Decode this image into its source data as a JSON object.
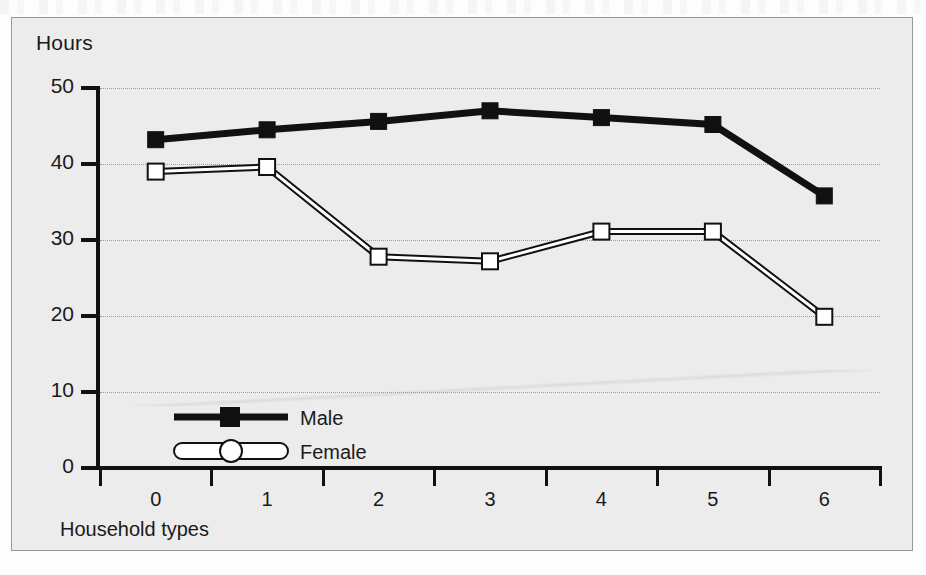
{
  "figure": {
    "background_color": "#ececec",
    "border_color": "#9a9a9a",
    "y_axis_title": "Hours",
    "x_axis_title": "Household types"
  },
  "chart_data": {
    "type": "line",
    "title": "",
    "subtitle": "",
    "xlabel": "Household types",
    "ylabel": "Hours",
    "categories": [
      "0",
      "1",
      "2",
      "3",
      "4",
      "5",
      "6"
    ],
    "x": [
      0,
      1,
      2,
      3,
      4,
      5,
      6
    ],
    "ylim": [
      0,
      50
    ],
    "xlim": [
      0,
      6
    ],
    "y_ticks": [
      0,
      10,
      20,
      30,
      40,
      50
    ],
    "y_tick_labels": [
      "0",
      "10",
      "20",
      "30",
      "40",
      "50"
    ],
    "x_ticks": [
      0,
      1,
      2,
      3,
      4,
      5,
      6
    ],
    "x_tick_labels": [
      "0",
      "1",
      "2",
      "3",
      "4",
      "5",
      "6"
    ],
    "grid": true,
    "grid_axis": "y",
    "grid_style": "dotted",
    "legend_position": "inside-lower-left",
    "series": [
      {
        "name": "Male",
        "color": "#111111",
        "marker": "filled-square",
        "line_width": 7,
        "values": [
          43.2,
          44.5,
          45.6,
          47.0,
          46.1,
          45.2,
          35.8
        ]
      },
      {
        "name": "Female",
        "color": "#ffffff",
        "edge_color": "#111111",
        "marker": "open-square",
        "line_width": 7,
        "values": [
          39.0,
          39.6,
          27.8,
          27.2,
          31.1,
          31.1,
          19.9
        ]
      }
    ]
  },
  "legend": {
    "entries": [
      {
        "label": "Male",
        "marker": "filled-square",
        "style": "solid-black-line"
      },
      {
        "label": "Female",
        "marker": "open-circle",
        "style": "outlined-white-line"
      }
    ]
  }
}
